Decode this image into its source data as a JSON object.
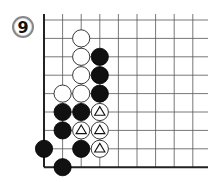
{
  "diagram": {
    "label": "9",
    "type": "go-board-corner",
    "grid": {
      "origin_x": 44,
      "origin_y": 20,
      "spacing_x": 18.6,
      "spacing_y": 18.4,
      "cols": 9,
      "rows": 9,
      "line_color": "#555555",
      "border_color": "#222222"
    },
    "stones": [
      {
        "color": "white",
        "col": 2,
        "row": 1,
        "mark": ""
      },
      {
        "color": "white",
        "col": 2,
        "row": 2,
        "mark": ""
      },
      {
        "color": "black",
        "col": 3,
        "row": 2,
        "mark": ""
      },
      {
        "color": "white",
        "col": 2,
        "row": 3,
        "mark": ""
      },
      {
        "color": "black",
        "col": 3,
        "row": 3,
        "mark": ""
      },
      {
        "color": "white",
        "col": 1,
        "row": 4,
        "mark": ""
      },
      {
        "color": "white",
        "col": 2,
        "row": 4,
        "mark": ""
      },
      {
        "color": "black",
        "col": 3,
        "row": 4,
        "mark": ""
      },
      {
        "color": "black",
        "col": 1,
        "row": 5,
        "mark": ""
      },
      {
        "color": "black",
        "col": 2,
        "row": 5,
        "mark": ""
      },
      {
        "color": "white",
        "col": 3,
        "row": 5,
        "mark": "triangle"
      },
      {
        "color": "black",
        "col": 1,
        "row": 6,
        "mark": ""
      },
      {
        "color": "white",
        "col": 2,
        "row": 6,
        "mark": "triangle"
      },
      {
        "color": "white",
        "col": 3,
        "row": 6,
        "mark": "triangle"
      },
      {
        "color": "black",
        "col": 0,
        "row": 7,
        "mark": ""
      },
      {
        "color": "black",
        "col": 2,
        "row": 7,
        "mark": ""
      },
      {
        "color": "white",
        "col": 3,
        "row": 7,
        "mark": "triangle"
      },
      {
        "color": "black",
        "col": 1,
        "row": 8,
        "mark": ""
      }
    ]
  }
}
